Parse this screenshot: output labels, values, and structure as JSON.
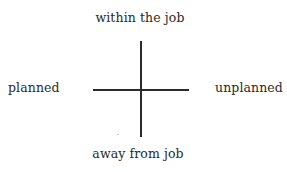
{
  "diagram": {
    "type": "quadrant-axes",
    "axes": {
      "vertical": {
        "top_label": "within the job",
        "bottom_label": "away from job"
      },
      "horizontal": {
        "left_label": "planned",
        "right_label": "unplanned"
      }
    },
    "colors": {
      "line": "#2b2b2b",
      "text": "#2a2a2a",
      "background": "#ffffff"
    }
  }
}
